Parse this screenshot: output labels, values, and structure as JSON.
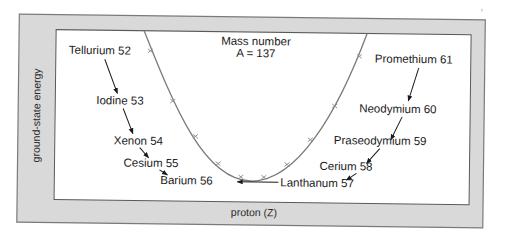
{
  "figure": {
    "title_line1": "Mass number",
    "title_line2": "A = 137",
    "xlabel": "proton (Z)",
    "ylabel": "ground-state energy",
    "scan_mark": "r",
    "colors": {
      "frame_fill": "#d9d9d9",
      "frame_stroke": "#777777",
      "plot_bg": "#ffffff",
      "curve": "#7a7a7a",
      "arrow": "#1a1a1a",
      "text": "#1a1a1a"
    }
  },
  "isobars": [
    {
      "element": "Tellurium",
      "Z": 52,
      "label": "Tellurium 52"
    },
    {
      "element": "Iodine",
      "Z": 53,
      "label": "Iodine 53"
    },
    {
      "element": "Xenon",
      "Z": 54,
      "label": "Xenon 54"
    },
    {
      "element": "Cesium",
      "Z": 55,
      "label": "Cesium 55"
    },
    {
      "element": "Barium",
      "Z": 56,
      "label": "Barium 56"
    },
    {
      "element": "Lanthanum",
      "Z": 57,
      "label": "Lanthanum 57"
    },
    {
      "element": "Cerium",
      "Z": 58,
      "label": "Cerium 58"
    },
    {
      "element": "Praseodymium",
      "Z": 59,
      "label": "Praseodymium 59"
    },
    {
      "element": "Neodymium",
      "Z": 60,
      "label": "Neodymium 60"
    },
    {
      "element": "Promethium",
      "Z": 61,
      "label": "Promethium 61"
    }
  ],
  "decay_chains": {
    "left": [
      "Tellurium 52",
      "Iodine 53",
      "Xenon 54",
      "Cesium 55",
      "Barium 56"
    ],
    "right": [
      "Promethium 61",
      "Neodymium 60",
      "Praseodymium 59",
      "Cerium 58",
      "Lanthanum 57",
      "Barium 56"
    ]
  }
}
